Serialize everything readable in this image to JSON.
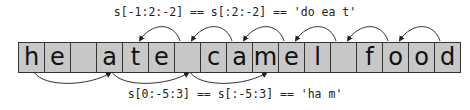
{
  "top_caption": "s[-1:2:-2] == s[:2:-2] == 'do ea t'",
  "bottom_caption": "s[0:-5:3] == s[:-5:3] == 'ha m'",
  "string": "he ate camel food",
  "cells": [
    "h",
    "e",
    " ",
    "a",
    "t",
    "e",
    " ",
    "c",
    "a",
    "m",
    "e",
    "l",
    " ",
    "f",
    "o",
    "o",
    "d"
  ],
  "top_arrows": [
    {
      "from": 16,
      "to": 14
    },
    {
      "from": 14,
      "to": 12
    },
    {
      "from": 12,
      "to": 10
    },
    {
      "from": 10,
      "to": 8
    },
    {
      "from": 8,
      "to": 6
    },
    {
      "from": 6,
      "to": 4
    }
  ],
  "bottom_arrows": [
    {
      "from": 0,
      "to": 3
    },
    {
      "from": 3,
      "to": 6
    },
    {
      "from": 6,
      "to": 9
    }
  ],
  "colors": {
    "cell_fill": "#c8c8c8",
    "cell_border": "#333333",
    "arrow": "#333333"
  }
}
